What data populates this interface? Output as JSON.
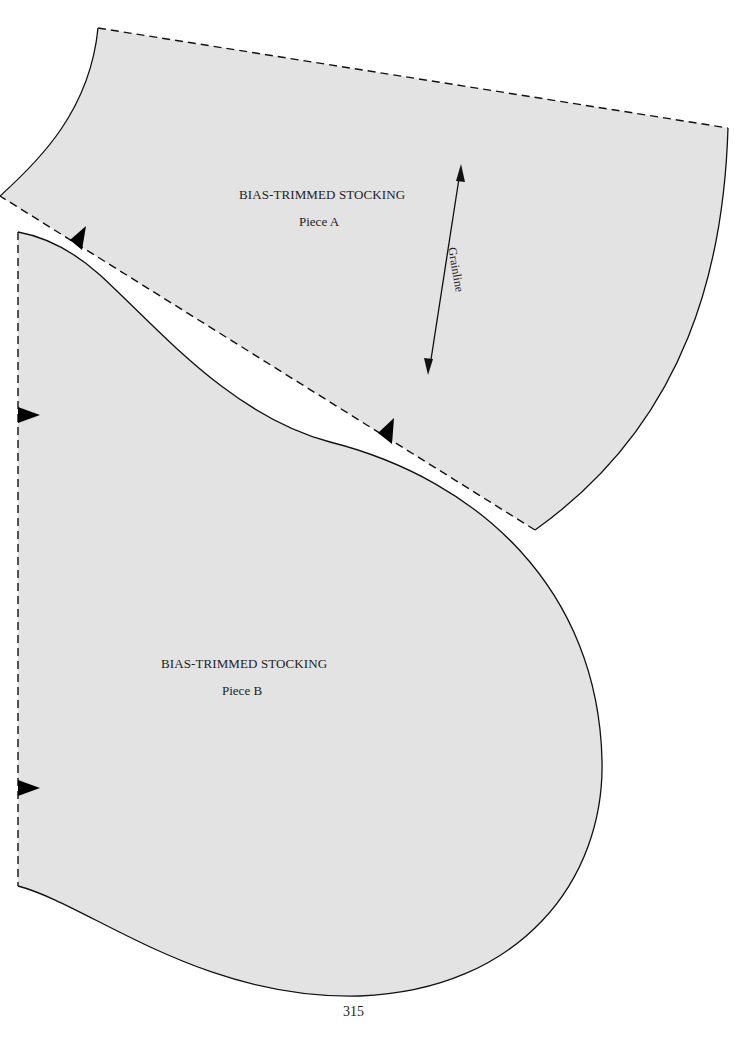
{
  "page": {
    "page_number": "315",
    "background_color": "#ffffff",
    "fabric_fill_color": "#e3e3e3",
    "line_color": "#111111"
  },
  "pieces": [
    {
      "id": "A",
      "title": "BIAS-TRIMMED STOCKING",
      "subtitle": "Piece A",
      "grainline_label": "Grainline",
      "notches": 2
    },
    {
      "id": "B",
      "title": "BIAS-TRIMMED STOCKING",
      "subtitle": "Piece B",
      "notches": 2
    }
  ],
  "legend": {
    "dashed_line": "seam / cut edge",
    "solid_line": "cutting edge",
    "triangle": "notch"
  }
}
